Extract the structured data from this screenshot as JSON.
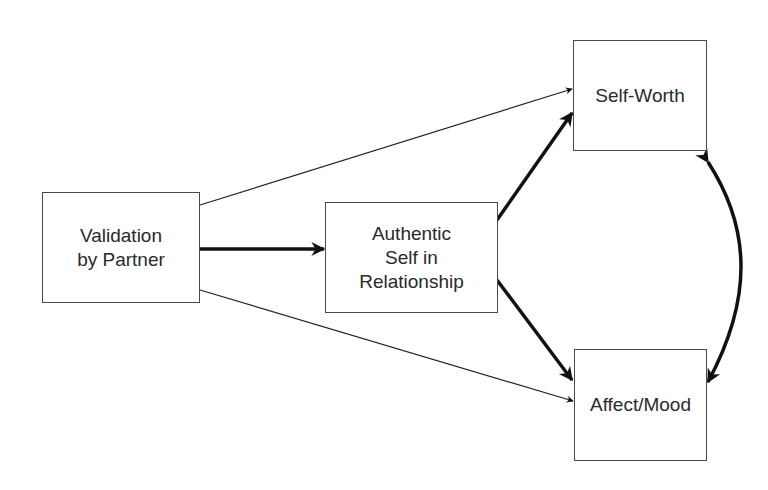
{
  "diagram": {
    "type": "path-model",
    "nodes": [
      {
        "id": "validation",
        "label": "Validation\nby Partner"
      },
      {
        "id": "authentic",
        "label": "Authentic\nSelf in\nRelationship"
      },
      {
        "id": "selfworth",
        "label": "Self-Worth"
      },
      {
        "id": "affect",
        "label": "Affect/Mood"
      }
    ],
    "edges": [
      {
        "from": "validation",
        "to": "authentic",
        "weight": "thick",
        "direction": "forward"
      },
      {
        "from": "validation",
        "to": "selfworth",
        "weight": "thin",
        "direction": "forward"
      },
      {
        "from": "validation",
        "to": "affect",
        "weight": "thin",
        "direction": "forward"
      },
      {
        "from": "authentic",
        "to": "selfworth",
        "weight": "thick",
        "direction": "forward"
      },
      {
        "from": "authentic",
        "to": "affect",
        "weight": "thick",
        "direction": "forward"
      },
      {
        "from": "selfworth",
        "to": "affect",
        "weight": "thick",
        "direction": "bidirectional",
        "shape": "curved"
      }
    ],
    "colors": {
      "line": "#111111",
      "border": "#4a4a4a",
      "text": "#2a2a2a",
      "background": "#ffffff"
    }
  }
}
